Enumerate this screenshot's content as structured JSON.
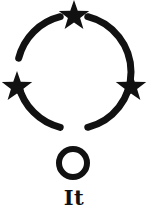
{
  "figure": {
    "caption": "It",
    "background_color": "#ffffff",
    "ink_color": "#111111",
    "canvas": {
      "width": 148,
      "height": 218
    }
  },
  "diagram": {
    "type": "symbol",
    "stroke_color": "#111111",
    "main_ring": {
      "name": "broken-circle",
      "center_x": 74,
      "center_y": 72,
      "radius": 57,
      "stroke_width": 7,
      "gaps_degrees": [
        {
          "start": 256,
          "end": 284
        },
        {
          "start": 166,
          "end": 194
        },
        {
          "start": 346,
          "end": 14
        }
      ],
      "arcs_degrees": [
        {
          "name": "upper-left-arc",
          "start": 194,
          "end": 256
        },
        {
          "name": "upper-right-arc",
          "start": 284,
          "end": 346
        },
        {
          "name": "lower-arc",
          "start": 14,
          "end": 166
        }
      ]
    },
    "stars": [
      {
        "name": "star-top",
        "center_x": 74,
        "center_y": 16,
        "radius": 16,
        "points": 5,
        "rotation_degrees": 0
      },
      {
        "name": "star-left",
        "center_x": 17,
        "center_y": 87,
        "radius": 16,
        "points": 5,
        "rotation_degrees": 0
      },
      {
        "name": "star-right",
        "center_x": 131,
        "center_y": 87,
        "radius": 16,
        "points": 5,
        "rotation_degrees": 0
      }
    ],
    "small_ring": {
      "name": "lower-open-circle",
      "center_x": 73,
      "center_y": 163,
      "radius": 14,
      "stroke_width": 6
    }
  }
}
